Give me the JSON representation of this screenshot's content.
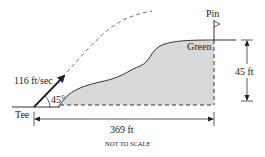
{
  "diagram": {
    "labels": {
      "pin": "Pin",
      "green": "Green",
      "tee": "Tee",
      "velocity": "116 ft/sec",
      "angle": "45°",
      "height": "45 ft",
      "distance": "369 ft",
      "note": "NOT TO SCALE"
    },
    "colors": {
      "ink": "#222222",
      "terrain_fill": "#d9d9d9",
      "trajectory": "#777777"
    }
  }
}
